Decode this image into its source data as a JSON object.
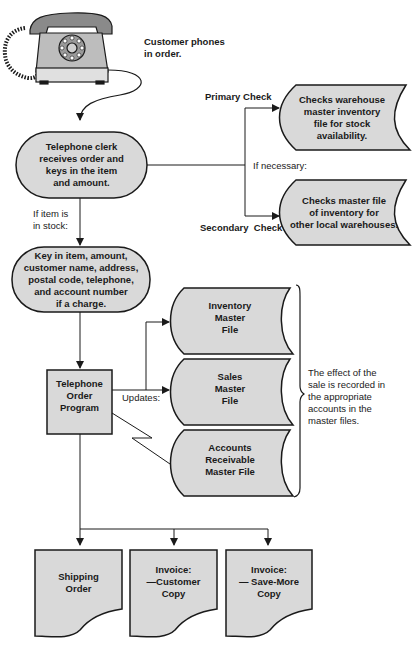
{
  "colors": {
    "fill": "#d9d9d9",
    "stroke": "#1a1a1a",
    "background": "#ffffff"
  },
  "start": {
    "icon": "telephone-icon",
    "caption": [
      "Customer phones",
      "in order."
    ]
  },
  "clerk": {
    "lines": [
      "Telephone clerk",
      "receives order and",
      "keys in the item",
      "and amount."
    ]
  },
  "checks": {
    "primary_label": "Primary Check",
    "secondary_label": "Secondary  Check",
    "if_necessary": "If necessary:",
    "primary_file": [
      "Checks warehouse",
      "master inventory",
      "file for stock",
      "availability."
    ],
    "secondary_file": [
      "Checks master file",
      "of inventory for",
      "other local warehouses."
    ]
  },
  "in_stock_label": [
    "If item is",
    "in stock:"
  ],
  "key_in": {
    "lines": [
      "Key in item, amount,",
      "customer name, address,",
      "postal code, telephone,",
      "and account number",
      "if a charge."
    ]
  },
  "program": {
    "lines": [
      "Telephone",
      "Order",
      "Program"
    ],
    "updates_label": "Updates:"
  },
  "master_files": [
    {
      "lines": [
        "Inventory",
        "Master",
        "File"
      ]
    },
    {
      "lines": [
        "Sales",
        "Master",
        "File"
      ]
    },
    {
      "lines": [
        "Accounts",
        "Receivable",
        "Master File"
      ]
    }
  ],
  "brace_note": [
    "The effect of the",
    "sale is recorded in",
    "the appropriate",
    "accounts in the",
    "master files."
  ],
  "outputs": [
    {
      "lines": [
        "Shipping",
        "Order"
      ]
    },
    {
      "lines": [
        "Invoice:",
        "—Customer",
        "Copy"
      ]
    },
    {
      "lines": [
        "Invoice:",
        "— Save-More",
        "Copy"
      ]
    }
  ]
}
